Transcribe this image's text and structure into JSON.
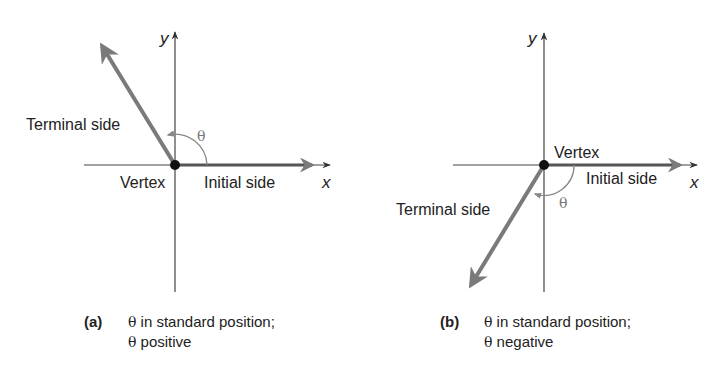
{
  "panels": [
    {
      "id": "a",
      "labels": {
        "y_axis": "y",
        "x_axis": "x",
        "terminal": "Terminal side",
        "vertex": "Vertex",
        "initial": "Initial side",
        "angle": "θ"
      },
      "caption": {
        "tag": "(a)",
        "line1_symbol": "θ",
        "line1_text": " in standard position;",
        "line2_symbol": "θ",
        "line2_text": " positive"
      }
    },
    {
      "id": "b",
      "labels": {
        "y_axis": "y",
        "x_axis": "x",
        "terminal": "Terminal side",
        "vertex": "Vertex",
        "initial": "Initial side",
        "angle": "θ"
      },
      "caption": {
        "tag": "(b)",
        "line1_symbol": "θ",
        "line1_text": " in standard position;",
        "line2_symbol": "θ",
        "line2_text": " negative"
      }
    }
  ],
  "colors": {
    "axis": "#444444",
    "ray": "#7a7a7a",
    "text": "#222222",
    "angle_arc": "#888888"
  }
}
